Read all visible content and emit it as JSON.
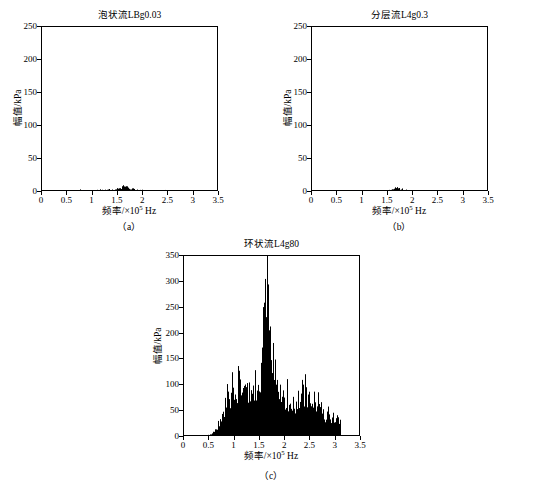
{
  "figure": {
    "axis_label_x": "频率/×10⁵ Hz",
    "axis_label_x_prefix": "频率/×10",
    "axis_label_x_exp": "5",
    "axis_label_x_suffix": " Hz",
    "axis_label_y": "幅值/kPa",
    "line_color": "#000000",
    "fill_color": "#000000",
    "background_color": "#ffffff"
  },
  "panels": [
    {
      "caption": "（a）",
      "title": "泡状流LBg0.03",
      "chart_data": {
        "type": "area",
        "title": "泡状流LBg0.03",
        "xlabel": "频率/×10⁵ Hz",
        "ylabel": "幅值/kPa",
        "xlim": [
          0,
          3.5
        ],
        "ylim": [
          0,
          250
        ],
        "xticks": [
          0,
          0.5,
          1,
          1.5,
          2,
          2.5,
          3,
          3.5
        ],
        "xtick_labels": [
          "0",
          "0.5",
          "1",
          "1.5",
          "2",
          "2.5",
          "3",
          "3.5"
        ],
        "yticks": [
          0,
          50,
          100,
          150,
          200,
          250
        ],
        "ytick_labels": [
          "0",
          "50",
          "100",
          "150",
          "200",
          "250"
        ],
        "grid": false,
        "legend": "none",
        "data_end_x": 3.1,
        "peak_x": 1.62,
        "peak_y": 14,
        "envelope_x": [
          0.0,
          0.1,
          0.2,
          0.3,
          0.4,
          0.5,
          0.6,
          0.7,
          0.75,
          0.8,
          0.9,
          1.0,
          1.05,
          1.1,
          1.15,
          1.2,
          1.25,
          1.3,
          1.35,
          1.4,
          1.45,
          1.5,
          1.55,
          1.6,
          1.62,
          1.65,
          1.7,
          1.75,
          1.8,
          1.85,
          1.9,
          1.95,
          2.0,
          2.05,
          2.1,
          2.2,
          2.3,
          2.4,
          2.45,
          2.5,
          2.6,
          2.7,
          2.8,
          2.9,
          3.0,
          3.05,
          3.1
        ],
        "envelope_y": [
          0.4,
          0.5,
          0.5,
          0.6,
          0.6,
          0.7,
          0.8,
          1.0,
          3.2,
          1.2,
          1.8,
          2.6,
          3.4,
          3.6,
          4.6,
          3.8,
          4.0,
          3.8,
          3.6,
          3.8,
          4.4,
          5.6,
          7.0,
          10.5,
          14.0,
          11.0,
          7.6,
          6.0,
          5.0,
          4.4,
          3.8,
          3.2,
          2.8,
          2.6,
          2.4,
          2.2,
          2.2,
          2.6,
          4.4,
          2.6,
          2.2,
          2.0,
          1.9,
          1.8,
          1.7,
          1.6,
          1.5
        ]
      }
    },
    {
      "caption": "（b）",
      "title": "分层流L4g0.3",
      "chart_data": {
        "type": "area",
        "title": "分层流L4g0.3",
        "xlabel": "频率/×10⁵ Hz",
        "ylabel": "幅值/kPa",
        "xlim": [
          0,
          3.5
        ],
        "ylim": [
          0,
          250
        ],
        "xticks": [
          0,
          0.5,
          1,
          1.5,
          2,
          2.5,
          3,
          3.5
        ],
        "xtick_labels": [
          "0",
          "0.5",
          "1",
          "1.5",
          "2",
          "2.5",
          "3",
          "3.5"
        ],
        "yticks": [
          0,
          50,
          100,
          150,
          200,
          250
        ],
        "ytick_labels": [
          "0",
          "50",
          "100",
          "150",
          "200",
          "250"
        ],
        "grid": false,
        "legend": "none",
        "data_end_x": 3.1,
        "peak_x": 1.67,
        "peak_y": 8,
        "envelope_x": [
          0.0,
          0.1,
          0.2,
          0.3,
          0.4,
          0.5,
          0.6,
          0.7,
          0.8,
          0.9,
          1.0,
          1.05,
          1.1,
          1.2,
          1.3,
          1.35,
          1.4,
          1.45,
          1.5,
          1.55,
          1.6,
          1.65,
          1.67,
          1.7,
          1.75,
          1.8,
          1.85,
          1.9,
          1.95,
          2.0,
          2.1,
          2.2,
          2.3,
          2.35,
          2.4,
          2.5,
          2.6,
          2.7,
          2.8,
          2.9,
          3.0,
          3.05,
          3.1
        ],
        "envelope_y": [
          0.3,
          0.3,
          0.4,
          0.4,
          0.4,
          0.5,
          0.6,
          0.7,
          0.9,
          1.2,
          1.6,
          2.4,
          1.8,
          1.9,
          2.0,
          2.6,
          2.2,
          2.4,
          2.8,
          3.6,
          5.2,
          7.2,
          8.0,
          7.0,
          5.4,
          4.2,
          3.4,
          2.8,
          2.4,
          2.0,
          1.8,
          1.8,
          2.0,
          2.8,
          2.0,
          1.8,
          1.6,
          1.5,
          1.4,
          1.4,
          1.3,
          1.3,
          1.2
        ]
      }
    },
    {
      "caption": "（c）",
      "title": "环状流L4g80",
      "chart_data": {
        "type": "area",
        "title": "环状流L4g80",
        "xlabel": "频率/×10⁵ Hz",
        "ylabel": "幅值/kPa",
        "xlim": [
          0,
          3.5
        ],
        "ylim": [
          0,
          350
        ],
        "xticks": [
          0,
          0.5,
          1,
          1.5,
          2,
          2.5,
          3,
          3.5
        ],
        "xtick_labels": [
          "0",
          "0.5",
          "1",
          "1.5",
          "2",
          "2.5",
          "3",
          "3.5"
        ],
        "yticks": [
          0,
          50,
          100,
          150,
          200,
          250,
          300,
          350
        ],
        "ytick_labels": [
          "0",
          "50",
          "100",
          "150",
          "200",
          "250",
          "300",
          "350"
        ],
        "grid": false,
        "legend": "none",
        "data_end_x": 3.1,
        "peak_x": 1.65,
        "peak_y": 340,
        "envelope_x": [
          0.0,
          0.1,
          0.2,
          0.3,
          0.4,
          0.5,
          0.55,
          0.6,
          0.65,
          0.7,
          0.75,
          0.8,
          0.85,
          0.9,
          0.95,
          1.0,
          1.05,
          1.1,
          1.15,
          1.2,
          1.25,
          1.3,
          1.35,
          1.4,
          1.45,
          1.5,
          1.55,
          1.6,
          1.63,
          1.65,
          1.68,
          1.7,
          1.75,
          1.8,
          1.85,
          1.9,
          1.95,
          2.0,
          2.05,
          2.1,
          2.15,
          2.2,
          2.25,
          2.3,
          2.35,
          2.4,
          2.45,
          2.5,
          2.55,
          2.6,
          2.65,
          2.7,
          2.8,
          2.9,
          3.0,
          3.05,
          3.1
        ],
        "envelope_y": [
          1.5,
          1.5,
          1.8,
          2.0,
          2.5,
          4.0,
          8.0,
          14.0,
          26.0,
          42.0,
          58.0,
          72.0,
          86.0,
          96.0,
          110.0,
          122.0,
          116.0,
          124.0,
          130.0,
          122.0,
          112.0,
          104.0,
          96.0,
          104.0,
          120.0,
          150.0,
          190.0,
          250.0,
          300.0,
          340.0,
          300.0,
          250.0,
          180.0,
          130.0,
          110.0,
          104.0,
          100.0,
          96.0,
          88.0,
          80.0,
          74.0,
          70.0,
          72.0,
          80.0,
          110.0,
          104.0,
          96.0,
          104.0,
          92.0,
          80.0,
          72.0,
          64.0,
          52.0,
          46.0,
          44.0,
          46.0,
          42.0
        ]
      }
    }
  ]
}
